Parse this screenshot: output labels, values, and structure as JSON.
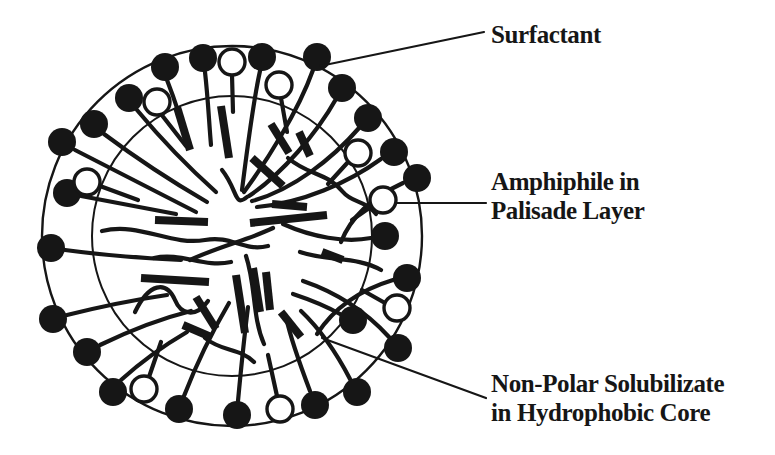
{
  "figure": {
    "type": "micelle-schematic",
    "description_visible": false
  },
  "colors": {
    "ink": "#161616",
    "background": "#ffffff"
  },
  "labels": {
    "surfactant": {
      "text": "Surfactant",
      "x": 491,
      "y": 20,
      "leader": [
        320,
        66,
        484,
        32
      ]
    },
    "amphiphile": {
      "line1": "Amphiphile in",
      "line2": "Palisade Layer",
      "x": 491,
      "y": 167,
      "leader": [
        397,
        203,
        486,
        203
      ]
    },
    "solubilizate": {
      "line1": "Non-Polar Solubilizate",
      "line2": "in Hydrophobic Core",
      "x": 491,
      "y": 369,
      "leader": [
        322,
        338,
        486,
        398
      ]
    }
  },
  "diagram": {
    "center": {
      "x": 232,
      "y": 236
    },
    "outer_radius": 190,
    "inner_radius": 140,
    "head_radius": 14,
    "open_head_radius": 13,
    "outer_stroke_width": 2.4,
    "inner_stroke_width": 2,
    "tail_stroke_width": 4.2,
    "bar_stroke_width": 8,
    "open_head_stroke_width": 3.4,
    "leader_stroke_width": 2.2,
    "filled_heads": [
      [
        165,
        67
      ],
      [
        203,
        58
      ],
      [
        262,
        57
      ],
      [
        317,
        57
      ],
      [
        342,
        88
      ],
      [
        368,
        118
      ],
      [
        394,
        152
      ],
      [
        417,
        178
      ],
      [
        385,
        236
      ],
      [
        407,
        278
      ],
      [
        353,
        320
      ],
      [
        398,
        348
      ],
      [
        357,
        392
      ],
      [
        315,
        405
      ],
      [
        237,
        415
      ],
      [
        179,
        409
      ],
      [
        113,
        392
      ],
      [
        87,
        352
      ],
      [
        53,
        319
      ],
      [
        51,
        248
      ],
      [
        67,
        193
      ],
      [
        62,
        142
      ],
      [
        94,
        124
      ],
      [
        129,
        98
      ]
    ],
    "open_heads": [
      [
        232,
        62
      ],
      [
        157,
        102
      ],
      [
        279,
        85
      ],
      [
        358,
        153
      ],
      [
        383,
        200
      ],
      [
        397,
        308
      ],
      [
        280,
        409
      ],
      [
        144,
        389
      ],
      [
        87,
        182
      ]
    ],
    "tails": [
      "M167,80 C176,103 182,122 187,143",
      "M205,72 C208,98 209,122 211,145",
      "M260,71 C253,102 247,150 242,190",
      "M313,70 C298,112 266,162 244,192",
      "M336,99 C317,133 282,174 249,196",
      "M359,128 C333,158 293,190 252,201",
      "M381,159 C348,183 302,203 257,207",
      "M403,183 C375,196 352,214 341,242",
      "M371,238 C345,243 312,237 283,224",
      "M393,280 C363,289 336,305 317,334",
      "M340,314 C324,305 308,299 293,294",
      "M389,337 C369,315 341,294 303,281",
      "M350,379 C336,352 321,330 301,311",
      "M310,391 C299,362 291,340 286,317",
      "M238,401 C241,369 244,339 248,307",
      "M184,396 C196,365 212,332 229,303",
      "M121,380 C142,361 163,346 187,332",
      "M100,345 C129,331 159,319 191,311",
      "M67,315 C99,307 133,300 167,295",
      "M65,250 C102,255 141,258 181,260",
      "M81,196 C112,202 143,208 176,214",
      "M75,150 C112,169 153,190 196,212",
      "M104,134 C136,158 171,181 207,202",
      "M137,110 C161,139 187,166 216,192",
      "M232,75 L233,112",
      "M161,114 L186,146",
      "M281,98 L287,132",
      "M349,161 L328,184",
      "M372,206 L352,220",
      "M385,303 L362,290",
      "M277,396 L268,355",
      "M149,377 L161,342",
      "M100,186 L138,200"
    ],
    "core_squiggles": [
      "M102,231 C140,222 170,246 205,240 C232,235 243,252 268,246",
      "M135,312 C149,283 166,280 175,300 C181,315 196,318 208,301",
      "M222,170 C238,190 234,208 247,197",
      "M288,158 C309,176 327,172 343,192 C352,203 365,200 376,214",
      "M246,256 C256,286 252,316 264,344",
      "M300,252 C330,262 356,256 381,270",
      "M154,258 C181,252 204,268 231,262",
      "M205,338 C222,352 240,348 254,362",
      "M190,260 C220,246 248,240 273,228"
    ],
    "bars": [
      [
        177,
        107,
        190,
        150
      ],
      [
        221,
        106,
        229,
        158
      ],
      [
        271,
        124,
        289,
        153
      ],
      [
        252,
        158,
        283,
        186
      ],
      [
        299,
        132,
        310,
        156
      ],
      [
        250,
        223,
        327,
        215
      ],
      [
        272,
        204,
        307,
        207
      ],
      [
        155,
        220,
        208,
        222
      ],
      [
        141,
        278,
        209,
        282
      ],
      [
        183,
        325,
        211,
        337
      ],
      [
        236,
        275,
        245,
        333
      ],
      [
        253,
        268,
        260,
        312
      ],
      [
        266,
        272,
        270,
        310
      ],
      [
        281,
        312,
        301,
        337
      ],
      [
        322,
        252,
        343,
        260
      ],
      [
        196,
        297,
        216,
        329
      ]
    ]
  }
}
